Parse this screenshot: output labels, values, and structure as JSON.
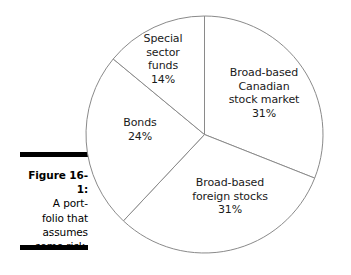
{
  "figure": {
    "caption_number": "Figure 16-1:",
    "caption_lines": [
      "A port-",
      "folio that",
      "assumes",
      "some risk."
    ],
    "rule_color": "#000000"
  },
  "chart_data": {
    "type": "pie",
    "title": "",
    "categories": [
      "Broad-based Canadian stock market",
      "Broad-based foreign stocks",
      "Bonds",
      "Special sector funds"
    ],
    "values": [
      31,
      31,
      24,
      14
    ],
    "unit": "%",
    "start_angle_deg": 0,
    "direction": "clockwise",
    "legend": "none",
    "grid": false,
    "slice_stroke": "#8a8a8a",
    "slice_fill": "#ffffff",
    "labels": [
      {
        "key": "canadian",
        "lines": [
          "Broad-based",
          "Canadian",
          "stock market",
          "31%"
        ],
        "value": 31
      },
      {
        "key": "foreign",
        "lines": [
          "Broad-based",
          "foreign stocks",
          "31%"
        ],
        "value": 31
      },
      {
        "key": "bonds",
        "lines": [
          "Bonds",
          "24%"
        ],
        "value": 24
      },
      {
        "key": "special",
        "lines": [
          "Special",
          "sector",
          "funds",
          "14%"
        ],
        "value": 14
      }
    ]
  }
}
